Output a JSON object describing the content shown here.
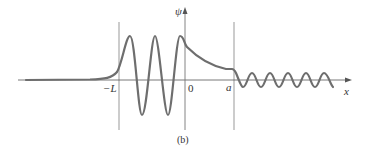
{
  "figure": {
    "caption": "(b)",
    "y_axis_label": "ψ",
    "x_axis_label": "x",
    "tick_labels": [
      "−L",
      "0",
      "a"
    ],
    "colors": {
      "curve": "#6e6e6e",
      "axes": "#555555",
      "boundaries": "#999999"
    }
  }
}
